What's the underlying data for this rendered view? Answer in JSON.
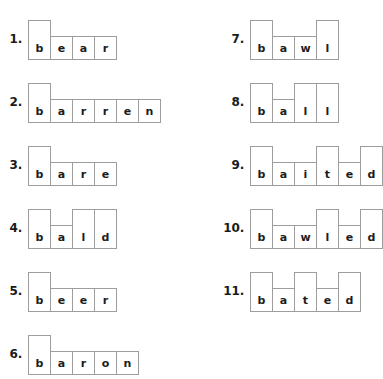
{
  "worksheet": {
    "title": "word-shape-boxes-worksheet",
    "box_border_color": "#9d9d9d",
    "letter_color": "#1c1c1c",
    "number_color": "#1a1a1a",
    "background_color": "#ffffff",
    "columns": [
      {
        "name": "left-column",
        "items": [
          {
            "number": "1.",
            "word": "bear",
            "letters": [
              {
                "letter": "b",
                "height": "tall"
              },
              {
                "letter": "e",
                "height": "short"
              },
              {
                "letter": "a",
                "height": "short"
              },
              {
                "letter": "r",
                "height": "short"
              }
            ]
          },
          {
            "number": "2.",
            "word": "barren",
            "letters": [
              {
                "letter": "b",
                "height": "tall"
              },
              {
                "letter": "a",
                "height": "short"
              },
              {
                "letter": "r",
                "height": "short"
              },
              {
                "letter": "r",
                "height": "short"
              },
              {
                "letter": "e",
                "height": "short"
              },
              {
                "letter": "n",
                "height": "short"
              }
            ]
          },
          {
            "number": "3.",
            "word": "bare",
            "letters": [
              {
                "letter": "b",
                "height": "tall"
              },
              {
                "letter": "a",
                "height": "short"
              },
              {
                "letter": "r",
                "height": "short"
              },
              {
                "letter": "e",
                "height": "short"
              }
            ]
          },
          {
            "number": "4.",
            "word": "bald",
            "letters": [
              {
                "letter": "b",
                "height": "tall"
              },
              {
                "letter": "a",
                "height": "short"
              },
              {
                "letter": "l",
                "height": "tall"
              },
              {
                "letter": "d",
                "height": "tall"
              }
            ]
          },
          {
            "number": "5.",
            "word": "beer",
            "letters": [
              {
                "letter": "b",
                "height": "tall"
              },
              {
                "letter": "e",
                "height": "short"
              },
              {
                "letter": "e",
                "height": "short"
              },
              {
                "letter": "r",
                "height": "short"
              }
            ]
          },
          {
            "number": "6.",
            "word": "baron",
            "letters": [
              {
                "letter": "b",
                "height": "tall"
              },
              {
                "letter": "a",
                "height": "short"
              },
              {
                "letter": "r",
                "height": "short"
              },
              {
                "letter": "o",
                "height": "short"
              },
              {
                "letter": "n",
                "height": "short"
              }
            ]
          }
        ]
      },
      {
        "name": "right-column",
        "items": [
          {
            "number": "7.",
            "word": "bawl",
            "letters": [
              {
                "letter": "b",
                "height": "tall"
              },
              {
                "letter": "a",
                "height": "short"
              },
              {
                "letter": "w",
                "height": "short"
              },
              {
                "letter": "l",
                "height": "tall"
              }
            ]
          },
          {
            "number": "8.",
            "word": "ball",
            "letters": [
              {
                "letter": "b",
                "height": "tall"
              },
              {
                "letter": "a",
                "height": "short"
              },
              {
                "letter": "l",
                "height": "tall"
              },
              {
                "letter": "l",
                "height": "tall"
              }
            ]
          },
          {
            "number": "9.",
            "word": "baited",
            "letters": [
              {
                "letter": "b",
                "height": "tall"
              },
              {
                "letter": "a",
                "height": "short"
              },
              {
                "letter": "i",
                "height": "short"
              },
              {
                "letter": "t",
                "height": "tall"
              },
              {
                "letter": "e",
                "height": "short"
              },
              {
                "letter": "d",
                "height": "tall"
              }
            ]
          },
          {
            "number": "10.",
            "word": "bawled",
            "letters": [
              {
                "letter": "b",
                "height": "tall"
              },
              {
                "letter": "a",
                "height": "short"
              },
              {
                "letter": "w",
                "height": "short"
              },
              {
                "letter": "l",
                "height": "tall"
              },
              {
                "letter": "e",
                "height": "short"
              },
              {
                "letter": "d",
                "height": "tall"
              }
            ]
          },
          {
            "number": "11.",
            "word": "bated",
            "letters": [
              {
                "letter": "b",
                "height": "tall"
              },
              {
                "letter": "a",
                "height": "short"
              },
              {
                "letter": "t",
                "height": "tall"
              },
              {
                "letter": "e",
                "height": "short"
              },
              {
                "letter": "d",
                "height": "tall"
              }
            ]
          }
        ]
      }
    ]
  }
}
